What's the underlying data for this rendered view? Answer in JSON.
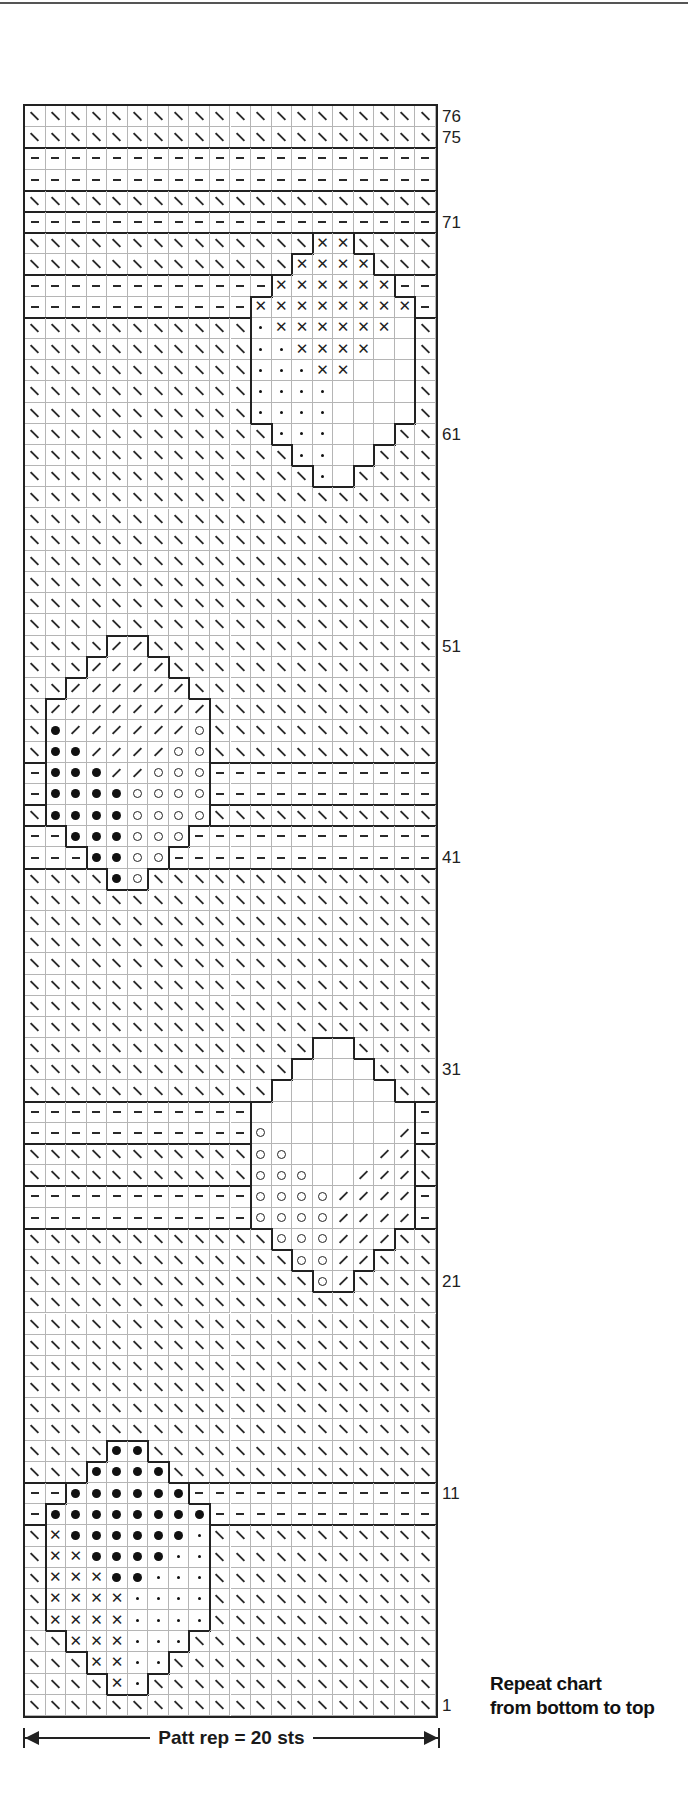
{
  "chart_data": {
    "type": "table",
    "columns": 20,
    "rows": 76,
    "row_order": "top_to_bottom_from_76_to_1",
    "row_labels": [
      "76",
      "75",
      "71",
      "61",
      "51",
      "41",
      "31",
      "21",
      "11",
      "1"
    ],
    "legend_codes": {
      "K": "backslash (\\) symbol",
      "P": "dash (-) symbol",
      "S": "slash (/) symbol",
      "X": "cross (x) symbol",
      "d": "small dot symbol",
      "B": "large filled dot symbol",
      "O": "open circle symbol",
      "_": "blank square"
    },
    "grid": [
      {
        "row": 76,
        "cells": "KKKKKKKKKKKKKKKKKKKK"
      },
      {
        "row": 75,
        "cells": "KKKKKKKKKKKKKKKKKKKK"
      },
      {
        "row": 74,
        "cells": "PPPPPPPPPPPPPPPPPPPP"
      },
      {
        "row": 73,
        "cells": "PPPPPPPPPPPPPPPPPPPP"
      },
      {
        "row": 72,
        "cells": "KKKKKKKKKKKKKKKKKKKK"
      },
      {
        "row": 71,
        "cells": "PPPPPPPPPPPPPPPPPPPP"
      },
      {
        "row": 70,
        "cells": "KKKKKKKKKKKKKKXXKKKK"
      },
      {
        "row": 69,
        "cells": "KKKKKKKKKKKKKXXXXKKK"
      },
      {
        "row": 68,
        "cells": "PPPPPPPPPPPPXXXXXXPP"
      },
      {
        "row": 67,
        "cells": "PPPPPPPPPPPXXXXXXXXP"
      },
      {
        "row": 66,
        "cells": "KKKKKKKKKKKdXXXXXX_K"
      },
      {
        "row": 65,
        "cells": "KKKKKKKKKKKddXXXX__K"
      },
      {
        "row": 64,
        "cells": "KKKKKKKKKKKdddXX___K"
      },
      {
        "row": 63,
        "cells": "KKKKKKKKKKKdddd____K"
      },
      {
        "row": 62,
        "cells": "KKKKKKKKKKKdddd____K"
      },
      {
        "row": 61,
        "cells": "KKKKKKKKKKKKddd___KK"
      },
      {
        "row": 60,
        "cells": "KKKKKKKKKKKKKdd__KKK"
      },
      {
        "row": 59,
        "cells": "KKKKKKKKKKKKKKd_KKKK"
      },
      {
        "row": 58,
        "cells": "KKKKKKKKKKKKKKKKKKKK"
      },
      {
        "row": 57,
        "cells": "KKKKKKKKKKKKKKKKKKKK"
      },
      {
        "row": 56,
        "cells": "KKKKKKKKKKKKKKKKKKKK"
      },
      {
        "row": 55,
        "cells": "KKKKKKKKKKKKKKKKKKKK"
      },
      {
        "row": 54,
        "cells": "KKKKKKKKKKKKKKKKKKKK"
      },
      {
        "row": 53,
        "cells": "KKKKKKKKKKKKKKKKKKKK"
      },
      {
        "row": 52,
        "cells": "KKKKKKKKKKKKKKKKKKKK"
      },
      {
        "row": 51,
        "cells": "KKKKSSKKKKKKKKKKKKKK"
      },
      {
        "row": 50,
        "cells": "KKKSSSSKKKKKKKKKKKKK"
      },
      {
        "row": 49,
        "cells": "KKSSSSSSKKKKKKKKKKKK"
      },
      {
        "row": 48,
        "cells": "KSSSSSSSSKKKKKKKKKKK"
      },
      {
        "row": 47,
        "cells": "KBSSSSSSOKKKKKKKKKKK"
      },
      {
        "row": 46,
        "cells": "KBBSSSSOOKKKKKKKKKKK"
      },
      {
        "row": 45,
        "cells": "PBBBSSOOOPPPPPPPPPPP"
      },
      {
        "row": 44,
        "cells": "PBBBBOOOOPPPPPPPPPPP"
      },
      {
        "row": 43,
        "cells": "KBBBBOOOOKKKKKKKKKKK"
      },
      {
        "row": 42,
        "cells": "PPBBBOOOPPPPPPPPPPPP"
      },
      {
        "row": 41,
        "cells": "PPPBBOOPPPPPPPPPPPPP"
      },
      {
        "row": 40,
        "cells": "KKKKBOKKKKKKKKKKKKKK"
      },
      {
        "row": 39,
        "cells": "KKKKKKKKKKKKKKKKKKKK"
      },
      {
        "row": 38,
        "cells": "KKKKKKKKKKKKKKKKKKKK"
      },
      {
        "row": 37,
        "cells": "KKKKKKKKKKKKKKKKKKKK"
      },
      {
        "row": 36,
        "cells": "KKKKKKKKKKKKKKKKKKKK"
      },
      {
        "row": 35,
        "cells": "KKKKKKKKKKKKKKKKKKKK"
      },
      {
        "row": 34,
        "cells": "KKKKKKKKKKKKKKKKKKKK"
      },
      {
        "row": 33,
        "cells": "KKKKKKKKKKKKKKKKKKKK"
      },
      {
        "row": 32,
        "cells": "KKKKKKKKKKKKKK__KKKK"
      },
      {
        "row": 31,
        "cells": "KKKKKKKKKKKKK____KKK"
      },
      {
        "row": 30,
        "cells": "KKKKKKKKKKKK______KK"
      },
      {
        "row": 29,
        "cells": "PPPPPPPPPPP________P"
      },
      {
        "row": 28,
        "cells": "PPPPPPPPPPPO______SP"
      },
      {
        "row": 27,
        "cells": "KKKKKKKKKKKOO____SSK"
      },
      {
        "row": 26,
        "cells": "KKKKKKKKKKKOOO__SSSK"
      },
      {
        "row": 25,
        "cells": "PPPPPPPPPPPOOOOSSSSP"
      },
      {
        "row": 24,
        "cells": "PPPPPPPPPPPOOOOSSSSP"
      },
      {
        "row": 23,
        "cells": "KKKKKKKKKKKKOOOSSSKK"
      },
      {
        "row": 22,
        "cells": "KKKKKKKKKKKKKOOSSKKK"
      },
      {
        "row": 21,
        "cells": "KKKKKKKKKKKKKKOSKKKK"
      },
      {
        "row": 20,
        "cells": "KKKKKKKKKKKKKKKKKKKK"
      },
      {
        "row": 19,
        "cells": "KKKKKKKKKKKKKKKKKKKK"
      },
      {
        "row": 18,
        "cells": "KKKKKKKKKKKKKKKKKKKK"
      },
      {
        "row": 17,
        "cells": "KKKKKKKKKKKKKKKKKKKK"
      },
      {
        "row": 16,
        "cells": "KKKKKKKKKKKKKKKKKKKK"
      },
      {
        "row": 15,
        "cells": "KKKKKKKKKKKKKKKKKKKK"
      },
      {
        "row": 14,
        "cells": "KKKKKKKKKKKKKKKKKKKK"
      },
      {
        "row": 13,
        "cells": "KKKKBBKKKKKKKKKKKKKK"
      },
      {
        "row": 12,
        "cells": "KKKBBBBKKKKKKKKKKKKK"
      },
      {
        "row": 11,
        "cells": "PPBBBBBBPPPPPPPPPPPP"
      },
      {
        "row": 10,
        "cells": "PBBBBBBBBPPPPPPPPPPP"
      },
      {
        "row": 9,
        "cells": "KXBBBBBBdKKKKKKKKKKK"
      },
      {
        "row": 8,
        "cells": "KXXBBBBddKKKKKKKKKKK"
      },
      {
        "row": 7,
        "cells": "KXXXBBdddKKKKKKKKKKK"
      },
      {
        "row": 6,
        "cells": "KXXXXddddKKKKKKKKKKK"
      },
      {
        "row": 5,
        "cells": "KXXXXddddKKKKKKKKKKK"
      },
      {
        "row": 4,
        "cells": "KKXXXdddKKKKKKKKKKKK"
      },
      {
        "row": 3,
        "cells": "KKKXXddKKKKKKKKKKKKK"
      },
      {
        "row": 2,
        "cells": "KKKKXdKKKKKKKKKKKKKK"
      },
      {
        "row": 1,
        "cells": "KKKKKKKKKKKKKKKKKKKK"
      }
    ],
    "annotations": {
      "pattern_repeat": "Patt rep = 20 sts",
      "instruction": [
        "Repeat chart",
        "from bottom to top"
      ]
    },
    "grid_on": true
  },
  "labels": {
    "pattern_repeat": "Patt rep = 20 sts",
    "caption_line1": "Repeat chart",
    "caption_line2": "from bottom to top"
  }
}
